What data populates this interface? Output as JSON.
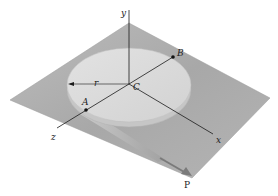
{
  "figure": {
    "type": "statics-diagram",
    "labels": {
      "y_axis": "y",
      "x_axis": "x",
      "z_axis": "z",
      "center": "C",
      "point_a": "A",
      "point_b": "B",
      "radius": "r",
      "force": "P"
    },
    "colors": {
      "plane": "#a9a9a9",
      "disk_top": "#dcdcdc",
      "disk_side": "#c9c9c9",
      "axis": "#1a1a1a",
      "strip": "#bdbdbd",
      "force_arrow": "#7a7a7a"
    }
  }
}
